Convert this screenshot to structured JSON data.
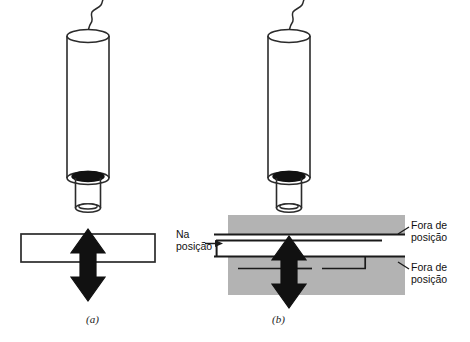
{
  "figure": {
    "background_color": "#ffffff",
    "ink_color": "#1a1a1a",
    "band_color": "#b3b3b3",
    "plate_fill": "#ffffff"
  },
  "captions": {
    "panel_a": "(a)",
    "panel_b": "(b)"
  },
  "labels": {
    "in_position": {
      "line1": "Na",
      "line2": "posição",
      "full": "Na posição"
    },
    "out_of_position_top": {
      "line1": "Fora de",
      "line2": "posição",
      "full": "Fora de posição"
    },
    "out_of_position_bottom": {
      "line1": "Fora de",
      "line2": "posição",
      "full": "Fora de posição"
    }
  },
  "panels": [
    {
      "id": "a",
      "caption": "(a)",
      "parts": [
        "wire",
        "cylinder",
        "nozzle",
        "white-plate",
        "double-arrow"
      ]
    },
    {
      "id": "b",
      "caption": "(b)",
      "parts": [
        "wire",
        "cylinder",
        "nozzle",
        "gray-band-top",
        "gray-band-bottom",
        "white-gap-plate",
        "double-arrow"
      ]
    }
  ]
}
